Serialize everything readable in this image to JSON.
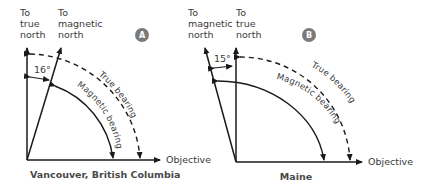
{
  "diagram_a": {
    "badge": "A",
    "true_north_label": [
      "To",
      "true",
      "north"
    ],
    "magnetic_north_label": [
      "To",
      "magnetic",
      "north"
    ],
    "declination": "16°",
    "true_bearing": "True bearing",
    "magnetic_bearing": "Magnetic bearing",
    "objective": "Objective",
    "caption": "Vancouver, British Columbia"
  },
  "diagram_b": {
    "badge": "B",
    "magnetic_north_label": [
      "To",
      "magnetic",
      "north"
    ],
    "true_north_label": [
      "To",
      "true",
      "north"
    ],
    "declination": "15°",
    "true_bearing": "True bearing",
    "magnetic_bearing": "Magnetic bearing",
    "objective": "Objective",
    "caption": "Maine"
  },
  "colors": {
    "line": "#1a1a1a",
    "badge": "#7a7a7a",
    "text": "#3a3a3a"
  }
}
